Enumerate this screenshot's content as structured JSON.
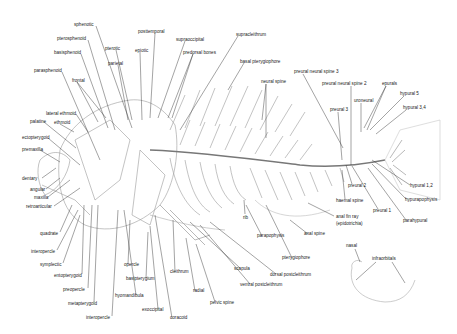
{
  "labels": [
    {
      "id": "sphenotic",
      "text": "sphenotic",
      "x": 74,
      "y": 23
    },
    {
      "id": "pterosphenoid",
      "text": "pterosphenoid",
      "x": 57,
      "y": 37
    },
    {
      "id": "basisphenoid",
      "text": "basisphenoid",
      "x": 54,
      "y": 51
    },
    {
      "id": "parasphenoid",
      "text": "parasphenoid",
      "x": 34,
      "y": 69
    },
    {
      "id": "frontal",
      "text": "frontal",
      "x": 72,
      "y": 79
    },
    {
      "id": "pterotic",
      "text": "pterotic",
      "x": 105,
      "y": 47
    },
    {
      "id": "parietal",
      "text": "parietal",
      "x": 108,
      "y": 62
    },
    {
      "id": "epiotic",
      "text": "epiotic",
      "x": 135,
      "y": 49
    },
    {
      "id": "posttemporal",
      "text": "posttemporal",
      "x": 138,
      "y": 30
    },
    {
      "id": "supraoccipital",
      "text": "supraoccipital",
      "x": 176,
      "y": 38
    },
    {
      "id": "predorsal-bones",
      "text": "predorsal bones",
      "x": 183,
      "y": 51
    },
    {
      "id": "supracleithrum",
      "text": "supracleithrum",
      "x": 236,
      "y": 33
    },
    {
      "id": "basal-pterygiophore",
      "text": "basal pterygiophore",
      "x": 240,
      "y": 60
    },
    {
      "id": "neural-spine",
      "text": "neural spine",
      "x": 261,
      "y": 80
    },
    {
      "id": "lateral-ethmoid",
      "text": "lateral ethmoid",
      "x": 46,
      "y": 112
    },
    {
      "id": "palatine",
      "text": "palatine",
      "x": 30,
      "y": 120
    },
    {
      "id": "ethmoid",
      "text": "ethmoid",
      "x": 54,
      "y": 121
    },
    {
      "id": "ectopterygoid",
      "text": "ectopterygoid",
      "x": 22,
      "y": 136
    },
    {
      "id": "premaxilla",
      "text": "premaxilla",
      "x": 22,
      "y": 148
    },
    {
      "id": "dentary",
      "text": "dentary",
      "x": 22,
      "y": 177
    },
    {
      "id": "angular",
      "text": "angular",
      "x": 30,
      "y": 188
    },
    {
      "id": "maxilla",
      "text": "maxilla",
      "x": 34,
      "y": 196
    },
    {
      "id": "retroarticular",
      "text": "retroarticular",
      "x": 26,
      "y": 205
    },
    {
      "id": "quadrate",
      "text": "quadrate",
      "x": 40,
      "y": 232
    },
    {
      "id": "interopercle-upper",
      "text": "interopercle",
      "x": 31,
      "y": 250
    },
    {
      "id": "symplectic",
      "text": "symplectic",
      "x": 40,
      "y": 263
    },
    {
      "id": "entopterygoid",
      "text": "entopterygoid",
      "x": 54,
      "y": 274
    },
    {
      "id": "preopercle",
      "text": "preopercle",
      "x": 63,
      "y": 288
    },
    {
      "id": "metapterygoid",
      "text": "metapterygoid",
      "x": 68,
      "y": 302
    },
    {
      "id": "interopercle-lower",
      "text": "interopercle",
      "x": 86,
      "y": 316
    },
    {
      "id": "opercle",
      "text": "opercle",
      "x": 124,
      "y": 263
    },
    {
      "id": "basipterygium",
      "text": "basipterygium",
      "x": 126,
      "y": 277
    },
    {
      "id": "hyomandibula",
      "text": "hyomandibula",
      "x": 115,
      "y": 294
    },
    {
      "id": "exoccipital",
      "text": "exoccipital",
      "x": 142,
      "y": 308
    },
    {
      "id": "coracoid",
      "text": "coracoid",
      "x": 170,
      "y": 316
    },
    {
      "id": "cleithrum",
      "text": "cleithrum",
      "x": 170,
      "y": 270
    },
    {
      "id": "radial",
      "text": "radial",
      "x": 193,
      "y": 289
    },
    {
      "id": "pelvic-spine",
      "text": "pelvic spine",
      "x": 210,
      "y": 301
    },
    {
      "id": "scapula",
      "text": "scapula",
      "x": 234,
      "y": 267
    },
    {
      "id": "ventral-postcleithrum",
      "text": "ventral postcleithrum",
      "x": 240,
      "y": 283
    },
    {
      "id": "dorsal-postcleithrum",
      "text": "dorsal postcleithrum",
      "x": 270,
      "y": 273
    },
    {
      "id": "rib",
      "text": "rib",
      "x": 243,
      "y": 216
    },
    {
      "id": "parapophysis",
      "text": "parapophysis",
      "x": 257,
      "y": 234
    },
    {
      "id": "pterygiophore",
      "text": "pterygiophore",
      "x": 282,
      "y": 256
    },
    {
      "id": "anal-spine",
      "text": "anal spine",
      "x": 304,
      "y": 232
    },
    {
      "id": "preural-neural-spine-3",
      "text": "preural neural spine 3",
      "x": 294,
      "y": 70
    },
    {
      "id": "preural-neural-spine-2",
      "text": "preural neural spine 2",
      "x": 322,
      "y": 82
    },
    {
      "id": "epurals",
      "text": "epurals",
      "x": 382,
      "y": 82
    },
    {
      "id": "hypural-5",
      "text": "hypural 5",
      "x": 400,
      "y": 92
    },
    {
      "id": "uroneural",
      "text": "uroneural",
      "x": 354,
      "y": 99
    },
    {
      "id": "hypural-3-4",
      "text": "hypural 3,4",
      "x": 403,
      "y": 106
    },
    {
      "id": "preural-3",
      "text": "preural 3",
      "x": 330,
      "y": 108
    },
    {
      "id": "preural-2",
      "text": "preural 2",
      "x": 348,
      "y": 184
    },
    {
      "id": "hypural-1-2",
      "text": "hypural 1,2",
      "x": 410,
      "y": 184
    },
    {
      "id": "haemal-spine",
      "text": "haemal spine",
      "x": 336,
      "y": 199
    },
    {
      "id": "hypurapophysis",
      "text": "hypurapophysis",
      "x": 405,
      "y": 198
    },
    {
      "id": "preural-1",
      "text": "preural 1",
      "x": 373,
      "y": 209
    },
    {
      "id": "anal-fin-ray",
      "text": "anal fin ray",
      "x": 336,
      "y": 215
    },
    {
      "id": "epidotrichia",
      "text": "(epidotrichia)",
      "x": 336,
      "y": 222
    },
    {
      "id": "parahypural",
      "text": "parahypural",
      "x": 403,
      "y": 219
    },
    {
      "id": "nasal",
      "text": "nasal",
      "x": 346,
      "y": 244
    },
    {
      "id": "infraorbitals",
      "text": "infraorbitals",
      "x": 372,
      "y": 257
    }
  ]
}
